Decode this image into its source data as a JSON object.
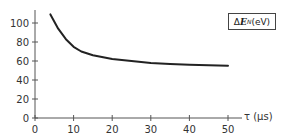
{
  "chart_data": {
    "type": "line",
    "title": "",
    "xlabel": "τ (μs)",
    "ylabel": "ΔE_N (eV)",
    "legend": [
      "ΔE_N (eV)"
    ],
    "legend_position": "top-right",
    "grid": false,
    "xlim": [
      0,
      50
    ],
    "ylim": [
      0,
      110
    ],
    "xticks": [
      0,
      10,
      20,
      30,
      40,
      50
    ],
    "yticks": [
      0,
      20,
      40,
      60,
      80,
      100
    ],
    "series": [
      {
        "name": "ΔE_N (eV)",
        "x": [
          4,
          6,
          8,
          10,
          12,
          15,
          20,
          25,
          30,
          35,
          40,
          45,
          50
        ],
        "y": [
          109,
          94,
          83,
          75,
          70,
          66,
          62,
          60,
          58,
          57,
          56,
          55.5,
          55
        ]
      }
    ],
    "color": "#222222"
  },
  "labels": {
    "legend_delta": "Δ",
    "legend_E": "E",
    "legend_sub": "N",
    "legend_unit": " (eV)",
    "xaxis": "τ (μs)"
  }
}
